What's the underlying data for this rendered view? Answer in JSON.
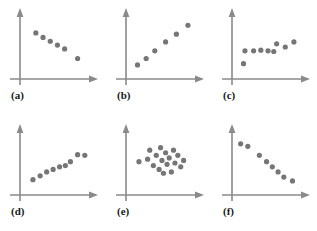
{
  "figure": {
    "title": "",
    "background_color": "#ffffff",
    "rows": 2,
    "cols": 3,
    "panel_width": 105,
    "panel_height": 115
  },
  "style": {
    "axis_color": "#8a8a8a",
    "dot_color": "#767676",
    "label_color": "#1a1a1a",
    "dot_radius": 2.6,
    "axis_width": 1.6
  },
  "chart_data": [
    {
      "type": "scatter",
      "panel": "a",
      "label": "(a)",
      "title": "",
      "xlabel": "",
      "ylabel": "",
      "xlim": [
        0,
        100
      ],
      "ylim": [
        0,
        100
      ],
      "grid": false,
      "legend": "none",
      "relationship": "strong negative linear",
      "x": [
        22,
        32,
        42,
        52,
        62,
        80
      ],
      "y": [
        72,
        65,
        59,
        53,
        47,
        32
      ]
    },
    {
      "type": "scatter",
      "panel": "b",
      "label": "(b)",
      "title": "",
      "xlabel": "",
      "ylabel": "",
      "xlim": [
        0,
        100
      ],
      "ylim": [
        0,
        100
      ],
      "grid": false,
      "legend": "none",
      "relationship": "strong positive linear",
      "x": [
        16,
        28,
        40,
        55,
        70,
        86
      ],
      "y": [
        22,
        32,
        44,
        58,
        70,
        84
      ]
    },
    {
      "type": "scatter",
      "panel": "c",
      "label": "(c)",
      "title": "",
      "xlabel": "",
      "ylabel": "",
      "xlim": [
        0,
        100
      ],
      "ylim": [
        0,
        100
      ],
      "grid": false,
      "legend": "none",
      "relationship": "weak positive",
      "x": [
        16,
        18,
        30,
        40,
        50,
        58,
        62,
        74,
        86
      ],
      "y": [
        24,
        44,
        44,
        45,
        44,
        43,
        55,
        50,
        58
      ]
    },
    {
      "type": "scatter",
      "panel": "d",
      "label": "(d)",
      "title": "",
      "xlabel": "",
      "ylabel": "",
      "xlim": [
        0,
        100
      ],
      "ylim": [
        0,
        100
      ],
      "grid": false,
      "legend": "none",
      "relationship": "moderate positive",
      "x": [
        18,
        28,
        37,
        46,
        55,
        63,
        70,
        80,
        90
      ],
      "y": [
        24,
        30,
        36,
        40,
        44,
        46,
        52,
        63,
        62
      ]
    },
    {
      "type": "scatter",
      "panel": "e",
      "label": "(e)",
      "title": "",
      "xlabel": "",
      "ylabel": "",
      "xlim": [
        0,
        100
      ],
      "ylim": [
        0,
        100
      ],
      "grid": false,
      "legend": "none",
      "relationship": "no correlation (random cloud)",
      "x": [
        18,
        30,
        33,
        38,
        42,
        46,
        48,
        50,
        52,
        55,
        57,
        60,
        63,
        66,
        68,
        72,
        76,
        80
      ],
      "y": [
        52,
        56,
        70,
        46,
        62,
        40,
        74,
        54,
        34,
        66,
        48,
        58,
        36,
        70,
        50,
        62,
        44,
        54
      ]
    },
    {
      "type": "scatter",
      "panel": "f",
      "label": "(f)",
      "title": "",
      "xlabel": "",
      "ylabel": "",
      "xlim": [
        0,
        100
      ],
      "ylim": [
        0,
        100
      ],
      "grid": false,
      "legend": "none",
      "relationship": "strong negative linear (steep)",
      "x": [
        12,
        22,
        38,
        48,
        56,
        64,
        72,
        84
      ],
      "y": [
        80,
        76,
        62,
        52,
        44,
        36,
        28,
        22
      ]
    }
  ]
}
